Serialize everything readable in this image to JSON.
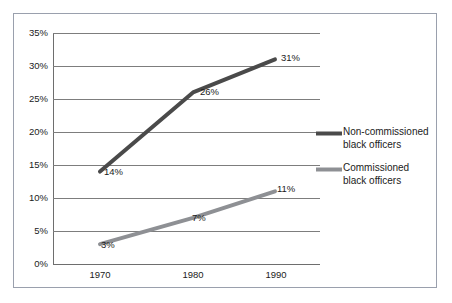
{
  "chart_data": {
    "type": "line",
    "title": "",
    "subtitle": "",
    "xlabel": "",
    "ylabel": "",
    "categories": [
      "1970",
      "1980",
      "1990"
    ],
    "x": [
      1970,
      1980,
      1990
    ],
    "xlim": [
      1970,
      1990
    ],
    "ylim": [
      0,
      35
    ],
    "y_ticks": [
      0,
      5,
      10,
      15,
      20,
      25,
      30,
      35
    ],
    "y_tick_labels": [
      "0%",
      "5%",
      "10%",
      "15%",
      "20%",
      "25%",
      "30%",
      "35%"
    ],
    "x_tick_labels": [
      "1970",
      "1980",
      "1990"
    ],
    "grid": "horizontal",
    "legend_position": "right",
    "series": [
      {
        "name": "Non-commissioned black officers",
        "color": "#4a4a4a",
        "line_width": 4,
        "values": [
          14,
          26,
          31
        ],
        "data_labels": [
          "14%",
          "26%",
          "31%"
        ]
      },
      {
        "name": "Commissioned black officers",
        "color": "#8e9094",
        "line_width": 4,
        "values": [
          3,
          7,
          11
        ],
        "data_labels": [
          "3%",
          "7%",
          "11%"
        ]
      }
    ]
  },
  "axes": {
    "y_ticks": [
      {
        "label": "35%",
        "value": 35
      },
      {
        "label": "30%",
        "value": 30
      },
      {
        "label": "25%",
        "value": 25
      },
      {
        "label": "20%",
        "value": 20
      },
      {
        "label": "15%",
        "value": 15
      },
      {
        "label": "10%",
        "value": 10
      },
      {
        "label": "5%",
        "value": 5
      },
      {
        "label": "0%",
        "value": 0
      }
    ],
    "x_ticks": [
      {
        "label": "1970"
      },
      {
        "label": "1980"
      },
      {
        "label": "1990"
      }
    ]
  },
  "point_labels": {
    "noncommissioned": [
      {
        "text": "14%"
      },
      {
        "text": "26%"
      },
      {
        "text": "31%"
      }
    ],
    "commissioned": [
      {
        "text": "3%"
      },
      {
        "text": "7%"
      },
      {
        "text": "11%"
      }
    ]
  },
  "legend": {
    "entries": [
      {
        "label": "Non-commissioned black officers",
        "color": "#4a4a4a"
      },
      {
        "label": "Commissioned black officers",
        "color": "#8e9094"
      }
    ]
  },
  "colors": {
    "series_noncommissioned": "#4a4a4a",
    "series_commissioned": "#8e9094",
    "gridline": "#7d7d7d",
    "frame_border": "#9aa0ad",
    "text": "#1b1b1b",
    "background": "#ffffff"
  }
}
